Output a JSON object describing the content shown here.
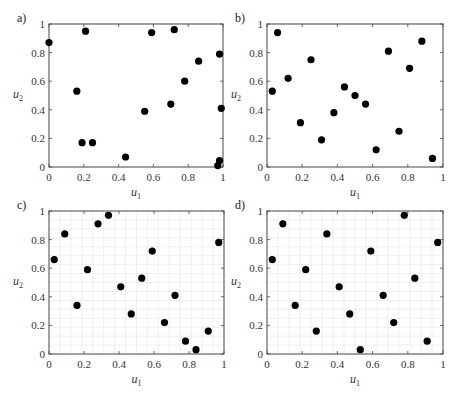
{
  "chart_data": [
    {
      "type": "scatter",
      "panel_label": "a)",
      "xlabel": "u",
      "xlabel_sub": "1",
      "ylabel": "u",
      "ylabel_sub": "2",
      "xlim": [
        0,
        1
      ],
      "ylim": [
        0,
        1
      ],
      "xticks": [
        "0",
        "0.2",
        "0.4",
        "0.6",
        "0.8",
        "1"
      ],
      "yticks": [
        "0",
        "0.2",
        "0.4",
        "0.6",
        "0.8",
        "1"
      ],
      "grid": false,
      "points": [
        [
          0.0,
          0.87
        ],
        [
          0.16,
          0.53
        ],
        [
          0.19,
          0.17
        ],
        [
          0.21,
          0.95
        ],
        [
          0.25,
          0.17
        ],
        [
          0.44,
          0.07
        ],
        [
          0.55,
          0.39
        ],
        [
          0.59,
          0.94
        ],
        [
          0.7,
          0.44
        ],
        [
          0.72,
          0.96
        ],
        [
          0.78,
          0.6
        ],
        [
          0.86,
          0.74
        ],
        [
          0.98,
          0.79
        ],
        [
          0.99,
          0.41
        ],
        [
          0.98,
          0.045
        ],
        [
          0.97,
          0.01
        ]
      ]
    },
    {
      "type": "scatter",
      "panel_label": "b)",
      "xlabel": "u",
      "xlabel_sub": "1",
      "ylabel": "u",
      "ylabel_sub": "2",
      "xlim": [
        0,
        1
      ],
      "ylim": [
        0,
        1
      ],
      "xticks": [
        "0",
        "0.2",
        "0.4",
        "0.6",
        "0.8",
        "1"
      ],
      "yticks": [
        "0",
        "0.2",
        "0.4",
        "0.6",
        "0.8",
        "1"
      ],
      "grid": false,
      "points": [
        [
          0.03,
          0.53
        ],
        [
          0.06,
          0.94
        ],
        [
          0.12,
          0.62
        ],
        [
          0.19,
          0.31
        ],
        [
          0.25,
          0.75
        ],
        [
          0.31,
          0.19
        ],
        [
          0.38,
          0.38
        ],
        [
          0.44,
          0.56
        ],
        [
          0.5,
          0.5
        ],
        [
          0.56,
          0.44
        ],
        [
          0.62,
          0.12
        ],
        [
          0.69,
          0.81
        ],
        [
          0.75,
          0.25
        ],
        [
          0.81,
          0.69
        ],
        [
          0.88,
          0.88
        ],
        [
          0.94,
          0.06
        ]
      ]
    },
    {
      "type": "scatter",
      "panel_label": "c)",
      "xlabel": "u",
      "xlabel_sub": "1",
      "ylabel": "u",
      "ylabel_sub": "2",
      "xlim": [
        0,
        1
      ],
      "ylim": [
        0,
        1
      ],
      "xticks": [
        "0",
        "0.2",
        "0.4",
        "0.6",
        "0.8",
        "1"
      ],
      "yticks": [
        "0",
        "0.2",
        "0.4",
        "0.6",
        "0.8",
        "1"
      ],
      "grid": true,
      "grid_divisions": 16,
      "points": [
        [
          0.03,
          0.66
        ],
        [
          0.09,
          0.84
        ],
        [
          0.16,
          0.34
        ],
        [
          0.22,
          0.59
        ],
        [
          0.28,
          0.91
        ],
        [
          0.34,
          0.97
        ],
        [
          0.41,
          0.47
        ],
        [
          0.47,
          0.28
        ],
        [
          0.53,
          0.53
        ],
        [
          0.59,
          0.72
        ],
        [
          0.66,
          0.22
        ],
        [
          0.72,
          0.41
        ],
        [
          0.78,
          0.09
        ],
        [
          0.84,
          0.03
        ],
        [
          0.91,
          0.16
        ],
        [
          0.97,
          0.78
        ]
      ]
    },
    {
      "type": "scatter",
      "panel_label": "d)",
      "xlabel": "u",
      "xlabel_sub": "1",
      "ylabel": "u",
      "ylabel_sub": "2",
      "xlim": [
        0,
        1
      ],
      "ylim": [
        0,
        1
      ],
      "xticks": [
        "0",
        "0.2",
        "0.4",
        "0.6",
        "0.8",
        "1"
      ],
      "yticks": [
        "0",
        "0.2",
        "0.4",
        "0.6",
        "0.8",
        "1"
      ],
      "grid": true,
      "grid_divisions": 16,
      "points": [
        [
          0.03,
          0.66
        ],
        [
          0.09,
          0.91
        ],
        [
          0.16,
          0.34
        ],
        [
          0.22,
          0.59
        ],
        [
          0.28,
          0.16
        ],
        [
          0.34,
          0.84
        ],
        [
          0.41,
          0.47
        ],
        [
          0.47,
          0.28
        ],
        [
          0.53,
          0.03
        ],
        [
          0.59,
          0.72
        ],
        [
          0.66,
          0.41
        ],
        [
          0.72,
          0.22
        ],
        [
          0.78,
          0.97
        ],
        [
          0.84,
          0.53
        ],
        [
          0.91,
          0.09
        ],
        [
          0.97,
          0.78
        ]
      ]
    }
  ]
}
